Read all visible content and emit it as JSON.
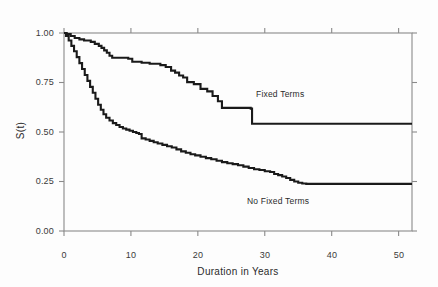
{
  "chart_data": {
    "type": "line",
    "title": "",
    "xlabel": "Duration in Years",
    "ylabel": "S(t)",
    "xlim": [
      0,
      52
    ],
    "ylim": [
      0,
      1.0
    ],
    "xticks": [
      0,
      10,
      20,
      30,
      40,
      50
    ],
    "xtick_labels": [
      "0",
      "10",
      "20",
      "30",
      "40",
      "50"
    ],
    "yticks": [
      0.0,
      0.25,
      0.5,
      0.75,
      1.0
    ],
    "ytick_labels": [
      "0.00",
      "0.25",
      "0.50",
      "0.75",
      "1.00"
    ],
    "grid": false,
    "legend_position": "inline-annotation",
    "step_type": "post",
    "line_color": "#1a1a1a",
    "axis_color": "#8a8a8a",
    "series": [
      {
        "name": "Fixed Terms",
        "annotation": "Fixed Terms",
        "annotation_x": 31,
        "annotation_y": 0.66,
        "x": [
          0,
          0.4,
          1.0,
          1.6,
          2.3,
          3.0,
          4.0,
          4.6,
          5.2,
          5.6,
          6.0,
          6.4,
          6.8,
          7.2,
          9.6,
          10.2,
          11.6,
          12.8,
          14.4,
          15.2,
          16.0,
          16.6,
          17.2,
          17.8,
          18.4,
          19.4,
          20.4,
          21.4,
          22.2,
          23.0,
          23.6,
          27.9,
          28.1,
          52
        ],
        "y": [
          1.0,
          0.995,
          0.985,
          0.975,
          0.968,
          0.962,
          0.955,
          0.945,
          0.935,
          0.925,
          0.912,
          0.9,
          0.885,
          0.875,
          0.87,
          0.855,
          0.85,
          0.845,
          0.838,
          0.828,
          0.81,
          0.8,
          0.785,
          0.775,
          0.752,
          0.742,
          0.718,
          0.705,
          0.682,
          0.655,
          0.622,
          0.618,
          0.542,
          0.542
        ]
      },
      {
        "name": "No Fixed Terms",
        "annotation": "No Fixed Terms",
        "annotation_x": 24,
        "annotation_y": 0.175,
        "x": [
          0,
          0.3,
          0.7,
          1.1,
          1.5,
          1.9,
          2.3,
          2.7,
          3.1,
          3.5,
          3.9,
          4.3,
          4.7,
          5.1,
          5.5,
          5.9,
          6.3,
          6.8,
          7.3,
          7.8,
          8.3,
          8.8,
          9.3,
          9.8,
          10.3,
          10.8,
          11.2,
          11.6,
          12.2,
          12.8,
          13.4,
          14.0,
          14.7,
          15.4,
          16.1,
          16.8,
          17.5,
          18.2,
          18.9,
          19.6,
          20.4,
          21.2,
          22.0,
          22.8,
          23.6,
          24.4,
          25.2,
          26.0,
          26.8,
          27.6,
          28.4,
          29.2,
          30.0,
          30.8,
          31.4,
          32.0,
          32.6,
          33.2,
          33.8,
          34.4,
          35.0,
          35.6,
          36.2,
          52
        ],
        "y": [
          1.0,
          0.985,
          0.962,
          0.935,
          0.908,
          0.878,
          0.848,
          0.818,
          0.788,
          0.758,
          0.728,
          0.698,
          0.668,
          0.638,
          0.612,
          0.59,
          0.572,
          0.558,
          0.545,
          0.535,
          0.525,
          0.518,
          0.512,
          0.506,
          0.5,
          0.495,
          0.49,
          0.468,
          0.462,
          0.455,
          0.448,
          0.442,
          0.435,
          0.428,
          0.422,
          0.412,
          0.402,
          0.395,
          0.388,
          0.382,
          0.375,
          0.368,
          0.362,
          0.355,
          0.348,
          0.342,
          0.338,
          0.332,
          0.325,
          0.318,
          0.312,
          0.308,
          0.302,
          0.298,
          0.288,
          0.282,
          0.275,
          0.268,
          0.258,
          0.25,
          0.244,
          0.24,
          0.238,
          0.238
        ]
      }
    ]
  }
}
